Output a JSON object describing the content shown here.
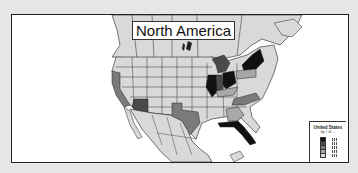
{
  "map": {
    "title": "North America",
    "colors": {
      "background_frame": "#e6e6e6",
      "panel": "#ffffff",
      "land_default": "#d9d9d9",
      "border": "#222222",
      "class_1": "#d9d9d9",
      "class_2": "#a8a8a8",
      "class_3": "#7a7a7a",
      "class_4": "#4a4a4a",
      "class_5": "#111111"
    },
    "highlighted_states": [
      {
        "name": "California",
        "class": "class_3"
      },
      {
        "name": "Arizona",
        "class": "class_4"
      },
      {
        "name": "Texas",
        "class": "class_3"
      },
      {
        "name": "Illinois",
        "class": "class_5"
      },
      {
        "name": "Indiana",
        "class": "class_4"
      },
      {
        "name": "Ohio",
        "class": "class_5"
      },
      {
        "name": "Michigan",
        "class": "class_4"
      },
      {
        "name": "New York",
        "class": "class_5"
      },
      {
        "name": "Pennsylvania",
        "class": "class_2"
      },
      {
        "name": "Kentucky",
        "class": "class_2"
      },
      {
        "name": "North Carolina",
        "class": "class_3"
      },
      {
        "name": "Georgia",
        "class": "class_2"
      },
      {
        "name": "Florida",
        "class": "class_5"
      }
    ]
  },
  "legend": {
    "title": "United States",
    "subtitle": "by # of ...",
    "rows": [
      {
        "class": "class_5"
      },
      {
        "class": "class_4"
      },
      {
        "class": "class_3"
      },
      {
        "class": "class_2"
      },
      {
        "class": "class_1"
      }
    ]
  }
}
